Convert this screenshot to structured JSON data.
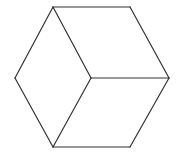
{
  "diagram": {
    "type": "isometric-cube-line-drawing",
    "background": "#ffffff",
    "stroke_color": "#333333",
    "stroke_width": 1.2,
    "vertices": {
      "top_left": [
        53,
        7
      ],
      "top_right": [
        130,
        7
      ],
      "right": [
        169,
        78
      ],
      "bottom_right": [
        130,
        147
      ],
      "bottom_left": [
        53,
        147
      ],
      "left": [
        15,
        78
      ],
      "center": [
        91,
        78
      ]
    },
    "edges": [
      [
        "top_left",
        "top_right"
      ],
      [
        "top_right",
        "right"
      ],
      [
        "right",
        "bottom_right"
      ],
      [
        "bottom_right",
        "bottom_left"
      ],
      [
        "bottom_left",
        "left"
      ],
      [
        "left",
        "top_left"
      ],
      [
        "top_left",
        "center"
      ],
      [
        "center",
        "right"
      ],
      [
        "center",
        "bottom_left"
      ]
    ]
  }
}
